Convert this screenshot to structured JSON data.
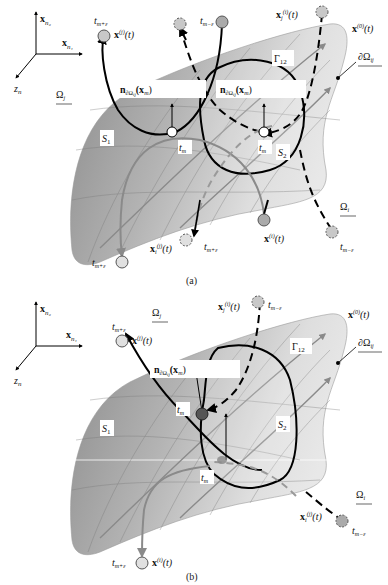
{
  "figure": {
    "panels": [
      {
        "id": "a",
        "caption": "(a)",
        "axes": {
          "x2": "x_{n2}",
          "x1": "x_{n1}",
          "z": "z_n"
        },
        "domains": {
          "omega_j": "Ω_j",
          "omega_i": "Ω_i",
          "boundary": "∂Ω_ij",
          "interface": "Γ_12"
        },
        "regions": {
          "s1": "S_1",
          "s2": "S_2"
        },
        "normals": [
          "n_∂Ω_ij(x_m)",
          "n_∂Ω_ij(x_m)"
        ],
        "trajectories": [
          {
            "name": "x^(j)(t)",
            "label_time": "t_{m+ε}",
            "end": "top-left"
          },
          {
            "name": "x_j^(i)(t)",
            "label_time": "t_{m-ε}",
            "style": "dashed"
          },
          {
            "name": "x^(i)(t)",
            "label_time": "",
            "end": "bottom-right"
          },
          {
            "name": "x_i^(j)(t)",
            "label_time": "t_{m+ε}",
            "style": "dashed"
          },
          {
            "name": "x^(0)(t)"
          }
        ],
        "points": {
          "tm_left": "t_m",
          "tm_right": "t_m"
        }
      },
      {
        "id": "b",
        "caption": "(b)",
        "axes": {
          "x2": "x_{n2}",
          "x1": "x_{n1}",
          "z": "z_n"
        },
        "domains": {
          "omega_j": "Ω_j",
          "omega_i": "Ω_i",
          "boundary": "∂Ω_ij",
          "interface": "Γ_12"
        },
        "regions": {
          "s1": "S_1",
          "s2": "S_2"
        },
        "normals": [
          "n_∂Ω_ij(x_m)"
        ],
        "trajectories": [
          {
            "name": "x^(j)(t)",
            "label_time": "t_{m+ε}"
          },
          {
            "name": "x_j^(i)(t)",
            "label_time": "t_{m-ε}",
            "style": "dashed"
          },
          {
            "name": "x^(i)(t)",
            "label_time": "t_{m+ε}"
          },
          {
            "name": "x_i^(j)(t)",
            "label_time": "t_{m-ε}",
            "style": "dashed"
          },
          {
            "name": "x^(0)(t)"
          }
        ],
        "points": {
          "tm_upper": "t_m",
          "tm_lower": "t_m"
        }
      }
    ]
  },
  "text": {
    "xn2": "x",
    "xn2_sub": "n₂",
    "xn1": "x",
    "xn1_sub": "n₁",
    "zn": "z",
    "zn_sub": "n",
    "omega_j": "Ω",
    "omega_j_sub": "j",
    "omega_i": "Ω",
    "omega_i_sub": "i",
    "d_omega": "∂Ω",
    "d_omega_sub": "ij",
    "gamma": "Γ",
    "gamma_sub": "12",
    "s": "S",
    "s1_sub": "1",
    "s2_sub": "2",
    "n_bold": "n",
    "n_sub": "∂Ω",
    "n_sub2": "ij",
    "n_arg": "(x",
    "n_arg_sub": "m",
    "n_close": ")",
    "t": "t",
    "tm_sub": "m",
    "tmpe_sub": "m+ε",
    "tmme_sub": "m−ε",
    "xj": "x",
    "sup_j": "(j)",
    "sup_i": "(i)",
    "sup_0": "(0)",
    "sub_j": "j",
    "sub_i": "i",
    "of_t": "(t)",
    "caption_a": "(a)",
    "caption_b": "(b)"
  }
}
